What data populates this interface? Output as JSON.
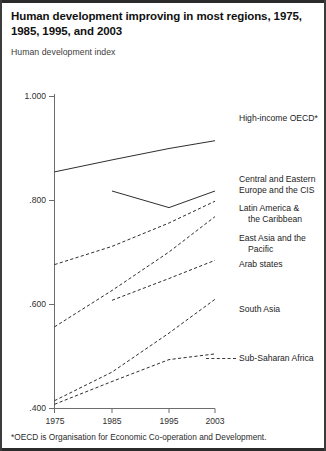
{
  "figure": {
    "title": "Human development improving in most regions, 1975, 1985, 1995, and 2003",
    "subtitle": "Human development index",
    "footnote": "*OECD is Organisation for Economic Co-operation and Development."
  },
  "axes": {
    "y_ticks": [
      "1.000",
      ".800",
      ".600",
      ".400"
    ],
    "x_ticks": [
      "1975",
      "1985",
      "1995",
      "2003"
    ]
  },
  "labels": {
    "oecd": "High-income OECD*",
    "cee_line1": "Central and Eastern",
    "cee_line2": "Europe and the CIS",
    "latam_line1": "Latin America &",
    "latam_line2": "the Caribbean",
    "eastasia_line1": "East Asia and the",
    "eastasia_line2": "Pacific",
    "arab": "Arab states",
    "southasia": "South Asia",
    "ssa": "Sub-Saharan Africa"
  },
  "chart_data": {
    "type": "line",
    "title": "Human development improving in most regions, 1975, 1985, 1995, and 2003",
    "subtitle": "Human development index",
    "xlabel": "",
    "ylabel": "Human development index",
    "x": [
      1975,
      1985,
      1995,
      2003
    ],
    "xlim": [
      1975,
      2003
    ],
    "ylim": [
      0.4,
      1.0
    ],
    "y_tick_values": [
      1.0,
      0.8,
      0.6,
      0.4
    ],
    "x_tick_values": [
      1975,
      1985,
      1995,
      2003
    ],
    "grid": false,
    "legend": "inline-right-of-lines",
    "footnote": "*OECD is Organisation for Economic Co-operation and Development.",
    "series": [
      {
        "name": "High-income OECD*",
        "style": "solid",
        "x": [
          1975,
          1985,
          1995,
          2003
        ],
        "values": [
          0.855,
          0.878,
          0.9,
          0.915
        ]
      },
      {
        "name": "Central and Eastern Europe and the CIS",
        "style": "solid",
        "x": [
          1985,
          1995,
          2003
        ],
        "values": [
          0.802,
          0.77,
          0.802
        ]
      },
      {
        "name": "Latin America & the Caribbean",
        "style": "dashed",
        "x": [
          1975,
          1985,
          1995,
          2003
        ],
        "values": [
          0.675,
          0.71,
          0.755,
          0.797
        ]
      },
      {
        "name": "East Asia and the Pacific",
        "style": "dashed",
        "x": [
          1975,
          1985,
          1995,
          2003
        ],
        "values": [
          0.555,
          0.625,
          0.7,
          0.768
        ]
      },
      {
        "name": "Arab states",
        "style": "dashed",
        "x": [
          1985,
          1995,
          2003
        ],
        "values": [
          0.608,
          0.65,
          0.685
        ]
      },
      {
        "name": "South Asia",
        "style": "dashed",
        "x": [
          1975,
          1985,
          1995,
          2003
        ],
        "values": [
          0.415,
          0.47,
          0.545,
          0.61
        ]
      },
      {
        "name": "Sub-Saharan Africa",
        "style": "dashed",
        "x": [
          1975,
          1985,
          1995,
          2003
        ],
        "values": [
          0.408,
          0.452,
          0.494,
          0.505
        ]
      }
    ]
  }
}
